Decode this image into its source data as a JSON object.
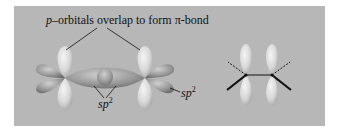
{
  "figure": {
    "title_label": {
      "prefix": "p",
      "rest": "–orbitals overlap to form π-bond"
    },
    "sp2_center": {
      "base": "sp",
      "sup": "2"
    },
    "sp2_right": {
      "base": "sp",
      "sup": "2"
    },
    "colors": {
      "background": "#b7b7b7",
      "lobe_light": "#e6e6e6",
      "lobe_mid": "#9f9f9f",
      "line": "#111111"
    }
  }
}
